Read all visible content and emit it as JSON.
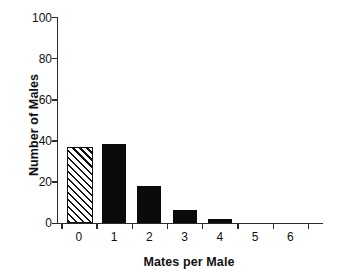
{
  "chart_data": {
    "type": "bar",
    "title": "",
    "xlabel": "Mates per Male",
    "ylabel": "Number of Males",
    "categories": [
      "0",
      "1",
      "2",
      "3",
      "4",
      "5",
      "6"
    ],
    "values": [
      36,
      38,
      18,
      6,
      2,
      0,
      0
    ],
    "series": [
      {
        "name": "Number of Males",
        "values": [
          36,
          38,
          18,
          6,
          2,
          0,
          0
        ]
      }
    ],
    "bar_styles": [
      "hatched",
      "solid",
      "solid",
      "solid",
      "solid",
      "solid",
      "solid"
    ],
    "ylim": [
      0,
      100
    ],
    "yticks": [
      "0",
      "20",
      "40",
      "60",
      "80",
      "100"
    ],
    "ytick_values": [
      0,
      20,
      40,
      60,
      80,
      100
    ],
    "xticks": [
      "0",
      "1",
      "2",
      "3",
      "4",
      "5",
      "6"
    ],
    "grid": false,
    "legend": "none",
    "colors": {
      "bar_solid": "#0b0b0b",
      "bar_hatch_line": "#111111",
      "bar_hatch_fill": "#ffffff",
      "axis": "#2b2b2b",
      "text": "#111111",
      "background": "#ffffff"
    }
  },
  "caption_fragment": ""
}
